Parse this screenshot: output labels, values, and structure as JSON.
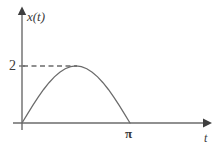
{
  "figure": {
    "background_color": "#ffffff",
    "line_color": "#6b6b6b",
    "text_color": "#3a3a3a"
  },
  "axes": {
    "y_axis_label": "x(t)",
    "x_axis_label": "t",
    "y_tick_label": "2",
    "x_tick_label": "π",
    "origin_px": {
      "x": 22,
      "y": 123
    }
  },
  "chart_data": {
    "type": "line",
    "title": "",
    "xlabel": "t",
    "ylabel": "x(t)",
    "xlim": [
      0,
      3.6
    ],
    "ylim": [
      0,
      2.75
    ],
    "xticks": [
      3.14159
    ],
    "xticklabels": [
      "π"
    ],
    "yticks": [
      2
    ],
    "yticklabels": [
      "2"
    ],
    "grid": false,
    "legend": null,
    "annotations": [
      {
        "kind": "dashed-guide",
        "from": [
          0,
          2
        ],
        "to": [
          1.5708,
          2
        ],
        "label": "2"
      }
    ],
    "series": [
      {
        "name": "x(t) = 2 sin(t)",
        "style": "solid",
        "domain": [
          0,
          3.14159
        ],
        "x": [
          0.0,
          0.1571,
          0.3142,
          0.4712,
          0.6283,
          0.7854,
          0.9425,
          1.0996,
          1.2566,
          1.4137,
          1.5708,
          1.7279,
          1.885,
          2.042,
          2.1991,
          2.3562,
          2.5133,
          2.6704,
          2.8274,
          2.9845,
          3.1416
        ],
        "y": [
          0.0,
          0.3129,
          0.618,
          0.908,
          1.1756,
          1.4142,
          1.618,
          1.782,
          1.9021,
          1.9754,
          2.0,
          1.9754,
          1.9021,
          1.782,
          1.618,
          1.4142,
          1.1756,
          0.908,
          0.618,
          0.3129,
          0.0
        ]
      }
    ]
  }
}
